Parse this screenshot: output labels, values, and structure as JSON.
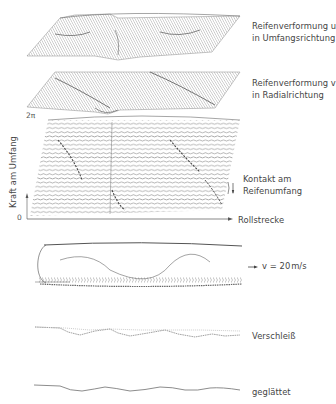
{
  "figure": {
    "panels": [
      {
        "id": "tire-deformation-u",
        "type": "3d-waterfall-surface",
        "label_line1": "Reifenverformung u",
        "label_line2": "in Umfangsrichtung"
      },
      {
        "id": "tire-deformation-v",
        "type": "3d-waterfall-surface",
        "label_line1": "Reifenverformung v",
        "label_line2": "in Radialrichtung"
      },
      {
        "id": "circumferential-force",
        "type": "3d-waterfall-lines",
        "y_axis_label": "Kraft am Umfang",
        "y_axis_top": "2π",
        "y_axis_bottom": "0",
        "x_axis_label": "Rollstrecke",
        "annotation_line1": "Kontakt am",
        "annotation_line2": "Reifenumfang"
      },
      {
        "id": "rolling-tire",
        "type": "tire-trace",
        "speed_label": "v = 20 m/s",
        "speed_value": "v = 20",
        "speed_unit": "m/s"
      },
      {
        "id": "wear",
        "type": "profile-line",
        "label": "Verschleiß"
      },
      {
        "id": "smoothed",
        "type": "profile-line",
        "label": "geglättet"
      }
    ]
  },
  "colors": {
    "line": "#6b6b6b",
    "light_line": "#9a9a9a",
    "text": "#444444",
    "background": "#ffffff"
  }
}
